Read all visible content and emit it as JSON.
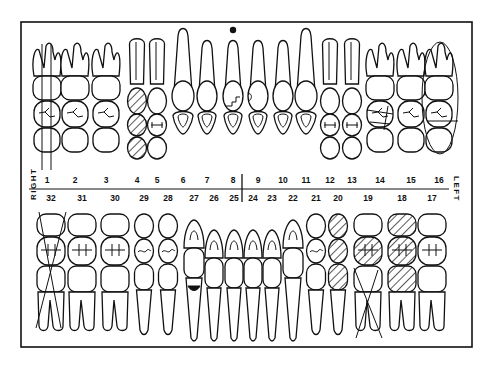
{
  "chart": {
    "side_labels": {
      "right": "RIGHT",
      "left": "LEFT"
    },
    "colors": {
      "ink": "#111111",
      "paper": "#ffffff"
    },
    "upper_arch": {
      "teeth": [
        {
          "number": "1",
          "type": "molar",
          "x": 47,
          "marking": "extracted-vertical-lines"
        },
        {
          "number": "2",
          "type": "molar",
          "x": 75,
          "marking": "none"
        },
        {
          "number": "3",
          "type": "molar",
          "x": 106,
          "marking": "none"
        },
        {
          "number": "4",
          "type": "premolar",
          "x": 137,
          "marking": "hatched-restoration"
        },
        {
          "number": "5",
          "type": "premolar",
          "x": 157,
          "marking": "none"
        },
        {
          "number": "6",
          "type": "canine",
          "x": 183,
          "marking": "none"
        },
        {
          "number": "7",
          "type": "incisor",
          "x": 207,
          "marking": "none"
        },
        {
          "number": "8",
          "type": "incisor",
          "x": 233,
          "marking": "fracture-and-apical-dot"
        },
        {
          "number": "9",
          "type": "incisor",
          "x": 258,
          "marking": "chip-mesial"
        },
        {
          "number": "10",
          "type": "incisor",
          "x": 283,
          "marking": "none"
        },
        {
          "number": "11",
          "type": "canine",
          "x": 306,
          "marking": "none"
        },
        {
          "number": "12",
          "type": "premolar",
          "x": 330,
          "marking": "none"
        },
        {
          "number": "13",
          "type": "premolar",
          "x": 352,
          "marking": "none"
        },
        {
          "number": "14",
          "type": "molar",
          "x": 380,
          "marking": "recurrent-lines"
        },
        {
          "number": "15",
          "type": "molar",
          "x": 411,
          "marking": "none"
        },
        {
          "number": "16",
          "type": "molar",
          "x": 439,
          "marking": "circled-impacted"
        }
      ]
    },
    "lower_arch": {
      "teeth": [
        {
          "number": "32",
          "type": "molar",
          "x": 51,
          "marking": "extracted-x"
        },
        {
          "number": "31",
          "type": "molar",
          "x": 82,
          "marking": "none"
        },
        {
          "number": "30",
          "type": "molar",
          "x": 115,
          "marking": "none"
        },
        {
          "number": "29",
          "type": "premolar",
          "x": 144,
          "marking": "none"
        },
        {
          "number": "28",
          "type": "premolar",
          "x": 168,
          "marking": "none"
        },
        {
          "number": "27",
          "type": "canine",
          "x": 194,
          "marking": "cervical-restoration"
        },
        {
          "number": "26",
          "type": "incisor",
          "x": 214,
          "marking": "none"
        },
        {
          "number": "25",
          "type": "incisor",
          "x": 234,
          "marking": "none"
        },
        {
          "number": "24",
          "type": "incisor",
          "x": 253,
          "marking": "none"
        },
        {
          "number": "23",
          "type": "incisor",
          "x": 272,
          "marking": "none"
        },
        {
          "number": "22",
          "type": "canine",
          "x": 293,
          "marking": "none"
        },
        {
          "number": "21",
          "type": "premolar",
          "x": 316,
          "marking": "none"
        },
        {
          "number": "20",
          "type": "premolar",
          "x": 338,
          "marking": "hatched-crown"
        },
        {
          "number": "19",
          "type": "molar",
          "x": 368,
          "marking": "hatched-occlusal-and-extracted-x"
        },
        {
          "number": "18",
          "type": "molar",
          "x": 402,
          "marking": "hatched-crown"
        },
        {
          "number": "17",
          "type": "molar",
          "x": 432,
          "marking": "none"
        }
      ]
    },
    "number_row_upper": [
      "1",
      "2",
      "3",
      "4",
      "5",
      "6",
      "7",
      "8",
      "9",
      "10",
      "11",
      "12",
      "13",
      "14",
      "15",
      "16"
    ],
    "number_row_lower": [
      "32",
      "31",
      "30",
      "29",
      "28",
      "27",
      "26",
      "25",
      "24",
      "23",
      "22",
      "21",
      "20",
      "19",
      "18",
      "17"
    ]
  }
}
